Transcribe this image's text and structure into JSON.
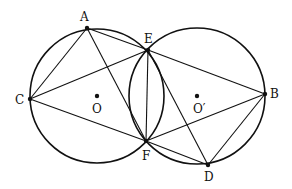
{
  "diagram": {
    "circles": [
      {
        "name": "O",
        "cx": 97,
        "cy": 96,
        "r": 67
      },
      {
        "name": "O'",
        "cx": 197,
        "cy": 96,
        "r": 68
      }
    ],
    "points": {
      "A": {
        "x": 87,
        "y": 28,
        "label": "A",
        "lx": 80,
        "ly": 21
      },
      "E": {
        "x": 148,
        "y": 50,
        "label": "E",
        "lx": 144,
        "ly": 43
      },
      "C": {
        "x": 30,
        "y": 99,
        "label": "C",
        "lx": 15,
        "ly": 104
      },
      "O": {
        "x": 97,
        "y": 96,
        "label": "O",
        "lx": 92,
        "ly": 113
      },
      "O2": {
        "x": 197,
        "y": 96,
        "label": "O′",
        "lx": 193,
        "ly": 113
      },
      "B": {
        "x": 265,
        "y": 94,
        "label": "B",
        "lx": 270,
        "ly": 98
      },
      "F": {
        "x": 146,
        "y": 141,
        "label": "F",
        "lx": 142,
        "ly": 160
      },
      "D": {
        "x": 208,
        "y": 165,
        "label": "D",
        "lx": 204,
        "ly": 181
      }
    },
    "segments": [
      [
        "A",
        "E"
      ],
      [
        "A",
        "C"
      ],
      [
        "A",
        "F"
      ],
      [
        "C",
        "E"
      ],
      [
        "C",
        "F"
      ],
      [
        "E",
        "F"
      ],
      [
        "E",
        "B"
      ],
      [
        "E",
        "D"
      ],
      [
        "F",
        "B"
      ],
      [
        "F",
        "D"
      ],
      [
        "B",
        "D"
      ]
    ]
  }
}
